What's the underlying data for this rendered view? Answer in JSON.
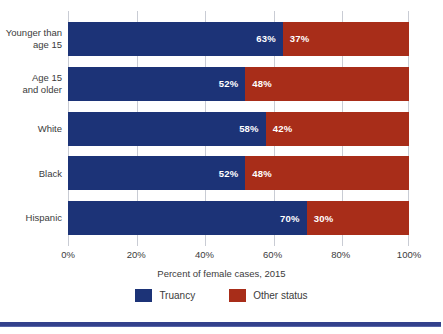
{
  "chart_data": {
    "type": "bar",
    "orientation": "horizontal",
    "stacked": true,
    "stacked_normalized": true,
    "title": "",
    "xlabel": "Percent of female cases, 2015",
    "ylabel": "",
    "xlim": [
      0,
      100
    ],
    "xticks": [
      0,
      20,
      40,
      60,
      80,
      100
    ],
    "xtick_labels": [
      "0%",
      "20%",
      "40%",
      "60%",
      "80%",
      "100%"
    ],
    "grid": true,
    "grid_axis": "x",
    "legend_position": "bottom-center",
    "categories": [
      "Younger than\nage 15",
      "Age 15\nand older",
      "White",
      "Black",
      "Hispanic"
    ],
    "series": [
      {
        "name": "Truancy",
        "color": "#1c3377",
        "values": [
          63,
          52,
          58,
          52,
          70
        ],
        "value_labels": [
          "63%",
          "52%",
          "58%",
          "52%",
          "70%"
        ]
      },
      {
        "name": "Other status",
        "color": "#a82d19",
        "values": [
          37,
          48,
          42,
          48,
          30
        ],
        "value_labels": [
          "37%",
          "48%",
          "42%",
          "48%",
          "30%"
        ]
      }
    ]
  },
  "legend": {
    "items": [
      {
        "label": "Truancy",
        "color": "#1c3377"
      },
      {
        "label": "Other status",
        "color": "#a82d19"
      }
    ]
  },
  "decor": {
    "bottom_rule_color": "#33418c",
    "gridline_color": "#c9ccd4",
    "value_label_color": "#ffffff",
    "text_color": "#3b3b3b"
  }
}
